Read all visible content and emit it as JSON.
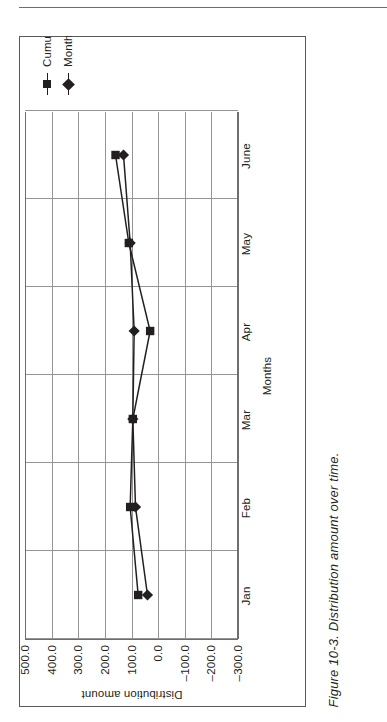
{
  "page": {
    "caption": "Figure 10-3. Distribution amount over time.",
    "rule_color": "#6d6e71",
    "frame_color": "#58595b"
  },
  "chart_data": {
    "type": "line",
    "title": "",
    "xlabel": "Months",
    "ylabel": "Distribution amount",
    "categories": [
      "Jan",
      "Feb",
      "Mar",
      "Apr",
      "May",
      "June"
    ],
    "ylim": [
      -300.0,
      500.0
    ],
    "yticks": [
      500.0,
      400.0,
      300.0,
      200.0,
      100.0,
      0.0,
      -100.0,
      -200.0,
      -300.0
    ],
    "ytick_labels": [
      "500.0",
      "400.0",
      "300.0",
      "200.0",
      "100.0",
      "0.0",
      "–100.0",
      "–200.0",
      "–300.0"
    ],
    "grid": "vertical-and-horizontal",
    "legend_position": "right",
    "series": [
      {
        "name": "Cumulative result",
        "marker": "square",
        "color": "#231f20",
        "values": [
          75,
          105,
          95,
          30,
          110,
          160
        ]
      },
      {
        "name": "Monthly result",
        "marker": "diamond",
        "color": "#231f20",
        "values": [
          40,
          85,
          95,
          90,
          105,
          130
        ]
      }
    ]
  },
  "legend": {
    "items": [
      {
        "label": "Cumulative result",
        "marker": "square"
      },
      {
        "label": "Monthly result",
        "marker": "diamond"
      }
    ]
  }
}
